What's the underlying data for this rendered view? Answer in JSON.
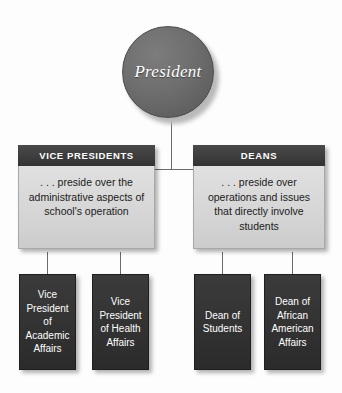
{
  "diagram": {
    "colors": {
      "background": "#fdfdfd",
      "root_fill": "#6e6e6e",
      "header_fill": "#3c3c3c",
      "panel_fill": "#d6d6d6",
      "leaf_fill": "#333333",
      "connector": "#6b6b6b",
      "light_text": "#ffffff",
      "dark_text": "#1b1b1b"
    },
    "root": {
      "label": "President",
      "shape": "circle"
    },
    "branches": [
      {
        "id": "vice-presidents",
        "header": "VICE PRESIDENTS",
        "description": ". . . preside over the administrative aspects of school's operation",
        "children": [
          {
            "id": "vp-academic-affairs",
            "label": "Vice President of Academic Affairs"
          },
          {
            "id": "vp-health-affairs",
            "label": "Vice President of Health Affairs"
          }
        ]
      },
      {
        "id": "deans",
        "header": "DEANS",
        "description": ". . . preside over operations and issues that directly involve students",
        "children": [
          {
            "id": "dean-of-students",
            "label": "Dean of Students"
          },
          {
            "id": "dean-african-american-affairs",
            "label": "Dean of African American Affairs"
          }
        ]
      }
    ]
  }
}
